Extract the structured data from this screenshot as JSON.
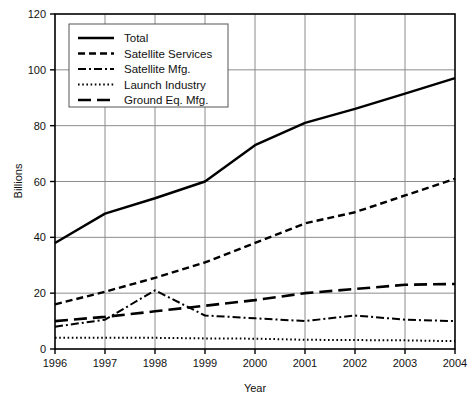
{
  "chart_data": {
    "type": "line",
    "title": "",
    "xlabel": "Year",
    "ylabel": "Billions",
    "x": [
      1996,
      1997,
      1998,
      1999,
      2000,
      2001,
      2002,
      2003,
      2004
    ],
    "categories": [
      "1996",
      "1997",
      "1998",
      "1999",
      "2000",
      "2001",
      "2002",
      "2003",
      "2004"
    ],
    "xlim": [
      1996,
      2004
    ],
    "ylim": [
      0,
      120
    ],
    "yticks": [
      0,
      20,
      40,
      60,
      80,
      100,
      120
    ],
    "ytick_labels": [
      "0",
      "20",
      "40",
      "60",
      "80",
      "100",
      "120"
    ],
    "xticks": [
      1996,
      1997,
      1998,
      1999,
      2000,
      2001,
      2002,
      2003,
      2004
    ],
    "xtick_labels": [
      "1996",
      "1997",
      "1998",
      "1999",
      "2000",
      "2001",
      "2002",
      "2003",
      "2004"
    ],
    "grid": true,
    "grid_color": "#8c8c8c",
    "legend_position": "upper left",
    "series": [
      {
        "name": "Total",
        "style": "solid",
        "color": "#000000",
        "values": [
          38,
          48.5,
          54,
          60,
          73,
          81,
          86,
          91.5,
          97
        ]
      },
      {
        "name": "Satellite Services",
        "style": "dashed",
        "color": "#000000",
        "values": [
          16,
          20.5,
          25.5,
          31,
          38,
          45,
          49,
          55,
          61
        ]
      },
      {
        "name": "Satellite Mfg.",
        "style": "dashdot",
        "color": "#000000",
        "values": [
          8,
          10.5,
          21,
          12,
          11,
          10,
          12,
          10.5,
          10
        ]
      },
      {
        "name": "Launch Industry",
        "style": "dotted",
        "color": "#000000",
        "values": [
          4,
          4,
          4,
          3.8,
          3.7,
          3.3,
          3.2,
          3.1,
          2.8
        ]
      },
      {
        "name": "Ground Eq. Mfg.",
        "style": "longdash",
        "color": "#000000",
        "values": [
          10,
          11.5,
          13.5,
          15.5,
          17.5,
          20,
          21.5,
          23,
          23.3
        ]
      }
    ]
  },
  "legend": {
    "items": [
      {
        "label": "Total"
      },
      {
        "label": "Satellite Services"
      },
      {
        "label": "Satellite Mfg."
      },
      {
        "label": "Launch Industry"
      },
      {
        "label": "Ground Eq. Mfg."
      }
    ]
  },
  "axes": {
    "y_title": "Billions",
    "x_title": "Year"
  }
}
